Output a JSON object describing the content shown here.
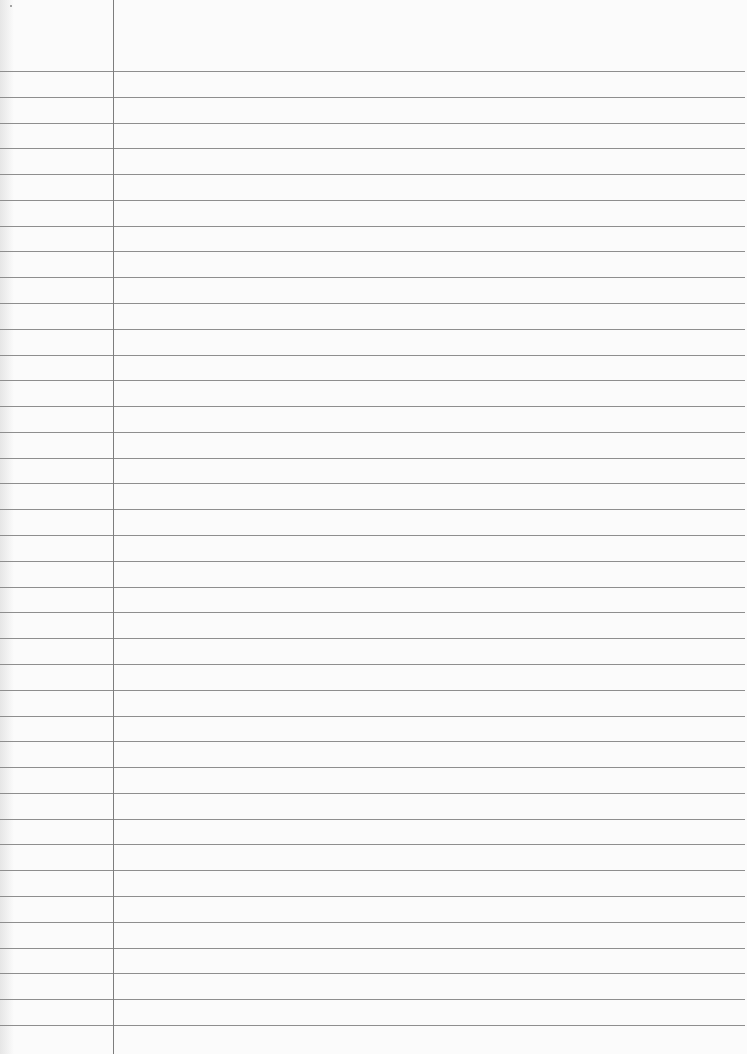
{
  "paper": {
    "type": "ruled-lined-paper",
    "width": 747,
    "height": 1054,
    "background_color": "#fbfbfb",
    "rule_color": "#8e8e8e",
    "margin_color": "#7d7d7d",
    "first_rule_y": 71,
    "rule_spacing": 25.78,
    "rule_count": 38,
    "rule_right_end": 745,
    "margin_x": 113,
    "margin_height": 1054
  }
}
